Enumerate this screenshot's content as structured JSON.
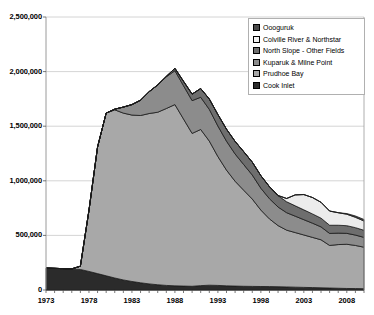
{
  "chart_data": {
    "type": "area",
    "stacked": true,
    "title": "",
    "xlabel": "",
    "ylabel": "",
    "xlim": [
      1973,
      2010
    ],
    "ylim": [
      0,
      2500000
    ],
    "ytick_labels": [
      "2,500,000",
      "2,000,000",
      "1,500,000",
      "1,000,000",
      "500,000",
      "0"
    ],
    "ytick_values": [
      2500000,
      2000000,
      1500000,
      1000000,
      500000,
      0
    ],
    "xtick_labels": [
      "1973",
      "1978",
      "1983",
      "1988",
      "1993",
      "1998",
      "2003",
      "2008"
    ],
    "xtick_values": [
      1973,
      1978,
      1983,
      1988,
      1993,
      1998,
      2003,
      2008
    ],
    "grid": "horizontal",
    "legend_position": "top-right",
    "x": [
      1973,
      1974,
      1975,
      1976,
      1977,
      1978,
      1979,
      1980,
      1981,
      1982,
      1983,
      1984,
      1985,
      1986,
      1987,
      1988,
      1989,
      1990,
      1991,
      1992,
      1993,
      1994,
      1995,
      1996,
      1997,
      1998,
      1999,
      2000,
      2001,
      2002,
      2003,
      2004,
      2005,
      2006,
      2007,
      2008,
      2009,
      2010
    ],
    "series": [
      {
        "name": "Cook Inlet",
        "color": "#2b2b2b",
        "values": [
          200000,
          198000,
          196000,
          193000,
          188000,
          170000,
          150000,
          130000,
          110000,
          92000,
          78000,
          66000,
          56000,
          48000,
          42000,
          38000,
          36000,
          34000,
          40000,
          44000,
          42000,
          38000,
          36000,
          34000,
          33000,
          32000,
          31000,
          30000,
          28000,
          26000,
          24000,
          22000,
          20000,
          18000,
          16000,
          14000,
          13000,
          12000
        ]
      },
      {
        "name": "Prudhoe Bay",
        "color": "#a8a8a8",
        "values": [
          0,
          0,
          0,
          0,
          30000,
          560000,
          1160000,
          1490000,
          1540000,
          1528000,
          1524000,
          1532000,
          1560000,
          1580000,
          1620000,
          1660000,
          1530000,
          1400000,
          1430000,
          1320000,
          1180000,
          1060000,
          960000,
          880000,
          800000,
          700000,
          620000,
          560000,
          520000,
          500000,
          480000,
          460000,
          440000,
          390000,
          400000,
          405000,
          395000,
          380000
        ]
      },
      {
        "name": "Kuparuk & Milne Point",
        "color": "#8c8c8c",
        "values": [
          0,
          0,
          0,
          0,
          0,
          0,
          0,
          0,
          6000,
          55000,
          96000,
          140000,
          200000,
          250000,
          290000,
          310000,
          305000,
          300000,
          295000,
          290000,
          280000,
          265000,
          250000,
          235000,
          220000,
          200000,
          185000,
          170000,
          160000,
          150000,
          140000,
          130000,
          118000,
          110000,
          105000,
          100000,
          95000,
          90000
        ]
      },
      {
        "name": "North Slope - Other Fields",
        "color": "#6e6e6e",
        "values": [
          0,
          0,
          0,
          0,
          0,
          0,
          0,
          0,
          0,
          0,
          0,
          0,
          0,
          0,
          4000,
          22000,
          40000,
          60000,
          80000,
          95000,
          105000,
          110000,
          115000,
          118000,
          118000,
          115000,
          110000,
          105000,
          100000,
          95000,
          90000,
          85000,
          80000,
          75000,
          72000,
          70000,
          68000,
          65000
        ]
      },
      {
        "name": "Colville River & Northstar",
        "color": "#ececec",
        "values": [
          0,
          0,
          0,
          0,
          0,
          0,
          0,
          0,
          0,
          0,
          0,
          0,
          0,
          0,
          0,
          0,
          0,
          0,
          0,
          0,
          0,
          0,
          0,
          0,
          0,
          0,
          0,
          0,
          30000,
          100000,
          140000,
          150000,
          145000,
          130000,
          115000,
          105000,
          95000,
          85000
        ]
      },
      {
        "name": "Oooguruk",
        "color": "#4a4a4a",
        "values": [
          0,
          0,
          0,
          0,
          0,
          0,
          0,
          0,
          0,
          0,
          0,
          0,
          0,
          0,
          0,
          0,
          0,
          0,
          0,
          0,
          0,
          0,
          0,
          0,
          0,
          0,
          0,
          0,
          0,
          0,
          0,
          0,
          0,
          0,
          0,
          6000,
          12000,
          14000
        ]
      }
    ],
    "legend": [
      {
        "label": "Oooguruk",
        "color": "#4a4a4a"
      },
      {
        "label": "Colville River & Northstar",
        "color": "#f2f2f2"
      },
      {
        "label": "North Slope - Other Fields",
        "color": "#6e6e6e"
      },
      {
        "label": "Kuparuk & Milne Point",
        "color": "#8c8c8c"
      },
      {
        "label": "Prudhoe Bay",
        "color": "#a8a8a8"
      },
      {
        "label": "Cook Inlet",
        "color": "#2b2b2b"
      }
    ]
  }
}
